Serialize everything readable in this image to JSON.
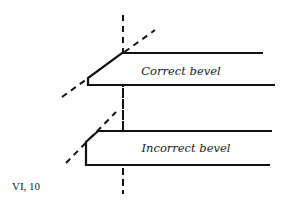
{
  "figure": {
    "number": "VI, 10",
    "panels": [
      {
        "label": "Correct bevel"
      },
      {
        "label": "Incorrect bevel"
      }
    ],
    "colors": {
      "ink": "#111111",
      "background": "#ffffff"
    }
  }
}
